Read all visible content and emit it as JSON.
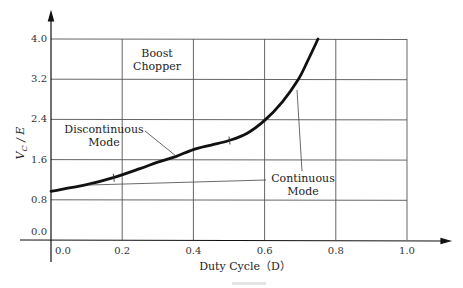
{
  "chart_data": {
    "type": "line",
    "title": "",
    "xlabel": "Duty Cycle (D)",
    "ylabel": "V_C / E",
    "xlim": [
      0.0,
      1.0
    ],
    "ylim": [
      0.0,
      4.0
    ],
    "grid": true,
    "x_ticks": [
      "0.0",
      "0.2",
      "0.4",
      "0.6",
      "0.8",
      "1.0"
    ],
    "y_ticks": [
      "0.0",
      "0.8",
      "1.6",
      "2.4",
      "3.2",
      "4.0"
    ],
    "series": [
      {
        "name": "Boost chopper V_C/E",
        "x": [
          0.0,
          0.1,
          0.175,
          0.25,
          0.3,
          0.35,
          0.4,
          0.45,
          0.5,
          0.55,
          0.6,
          0.65,
          0.695,
          0.72,
          0.75
        ],
        "y": [
          0.97,
          1.1,
          1.24,
          1.42,
          1.55,
          1.66,
          1.8,
          1.89,
          1.98,
          2.12,
          2.38,
          2.75,
          3.2,
          3.55,
          4.0
        ]
      }
    ],
    "annotations": [
      {
        "text": "Boost\nChopper",
        "x": 0.35,
        "y": 3.55
      },
      {
        "text": "Discontinuous\nMode",
        "x": 0.17,
        "y": 2.1,
        "points_to": {
          "x": 0.35,
          "y": 1.66
        }
      },
      {
        "text": "Continuous\nMode",
        "x": 0.74,
        "y": 1.35,
        "points_to": [
          {
            "x": 0.7,
            "y": 3.0
          },
          {
            "x": 0.1,
            "y": 1.12
          }
        ]
      }
    ],
    "markers": [
      {
        "x": 0.175,
        "y": 1.24,
        "kind": "tick"
      },
      {
        "x": 0.5,
        "y": 1.98,
        "kind": "tick"
      }
    ],
    "legend": null
  },
  "labels": {
    "xlabel": "Duty Cycle（D）",
    "ylabel_main": "V",
    "ylabel_sub": "C",
    "ylabel_tail": " / E",
    "boost_line1": "Boost",
    "boost_line2": "Chopper",
    "disc_line1": "Discontinuous",
    "disc_line2": "Mode",
    "cont_line1": "Continuous",
    "cont_line2": "Mode"
  }
}
